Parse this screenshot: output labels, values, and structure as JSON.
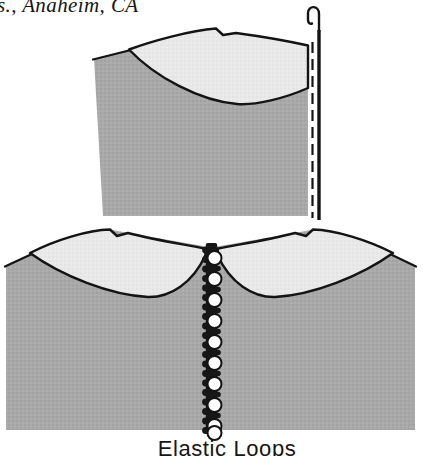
{
  "page": {
    "credit_text": "s., Anaheim, CA",
    "caption": "Elastic Loops"
  },
  "figure": {
    "top_diagram_name": "hook-and-eye-placket-closure",
    "bottom_diagram_name": "elastic-loop-button-closure"
  },
  "colors": {
    "body_gray": "#a9a9a9",
    "collar_gray": "#e9e9e9",
    "outline": "#141414",
    "band_black": "#171717",
    "button_white": "#ffffff",
    "background": "#ffffff"
  }
}
